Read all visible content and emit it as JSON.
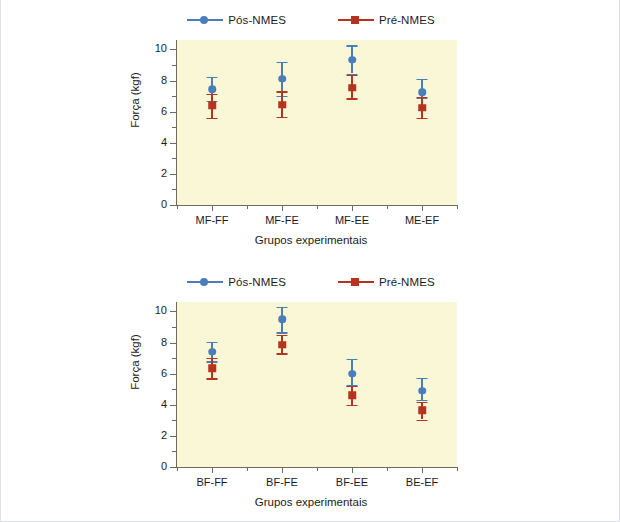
{
  "figure": {
    "background": "#ffffff",
    "plot_background": "#faf7d6",
    "series_colors": {
      "pos": "#4a7ebb",
      "pre": "#b5331f"
    }
  },
  "legend": {
    "entries": [
      {
        "label": "Pós-NMES",
        "marker": "circle",
        "color": "#4a7ebb"
      },
      {
        "label": "Pré-NMES",
        "marker": "square",
        "color": "#b5331f"
      }
    ]
  },
  "charts": [
    {
      "id": "chart-1",
      "xlabel": "Grupos experimentais",
      "ylabel": "Força (kgf)",
      "yticks": [
        "0",
        "2",
        "4",
        "6",
        "8",
        "10"
      ],
      "categories": [
        "MF-FF",
        "MF-FE",
        "MF-EE",
        "ME-EF"
      ]
    },
    {
      "id": "chart-2",
      "xlabel": "Grupos experimentais",
      "ylabel": "Força (kgf)",
      "yticks": [
        "0",
        "2",
        "4",
        "6",
        "8",
        "10"
      ],
      "categories": [
        "BF-FF",
        "BF-FE",
        "BF-EE",
        "BE-EF"
      ]
    }
  ],
  "chart_data": [
    {
      "type": "scatter",
      "title": "",
      "xlabel": "Grupos experimentais",
      "ylabel": "Força (kgf)",
      "ylim": [
        0,
        10.6
      ],
      "ytick_values": [
        0,
        2,
        4,
        6,
        8,
        10
      ],
      "grid": false,
      "legend_position": "top-center",
      "categories": [
        "MF-FF",
        "MF-FE",
        "MF-EE",
        "ME-EF"
      ],
      "series": [
        {
          "name": "Pós-NMES",
          "color": "#4a7ebb",
          "values": [
            7.45,
            8.1,
            9.35,
            7.25
          ],
          "err_low": [
            6.7,
            7.0,
            8.45,
            6.9
          ],
          "err_high": [
            8.25,
            9.2,
            10.25,
            8.1
          ]
        },
        {
          "name": "Pré-NMES",
          "color": "#b5331f",
          "values": [
            6.4,
            6.45,
            7.55,
            6.25
          ],
          "err_low": [
            5.6,
            5.65,
            6.85,
            5.6
          ],
          "err_high": [
            7.15,
            7.3,
            8.35,
            6.95
          ]
        }
      ]
    },
    {
      "type": "scatter",
      "title": "",
      "xlabel": "Grupos experimentais",
      "ylabel": "Força (kgf)",
      "ylim": [
        0,
        10.6
      ],
      "ytick_values": [
        0,
        2,
        4,
        6,
        8,
        10
      ],
      "grid": false,
      "legend_position": "top-center",
      "categories": [
        "BF-FF",
        "BF-FE",
        "BF-EE",
        "BE-EF"
      ],
      "series": [
        {
          "name": "Pós-NMES",
          "color": "#4a7ebb",
          "values": [
            7.4,
            9.5,
            6.0,
            4.9
          ],
          "err_low": [
            6.8,
            8.65,
            5.25,
            4.3
          ],
          "err_high": [
            8.05,
            10.3,
            6.95,
            5.75
          ]
        },
        {
          "name": "Pré-NMES",
          "color": "#b5331f",
          "values": [
            6.35,
            7.85,
            4.6,
            3.65
          ],
          "err_low": [
            5.7,
            7.3,
            4.0,
            3.05
          ],
          "err_high": [
            7.0,
            8.5,
            5.2,
            4.2
          ]
        }
      ]
    }
  ]
}
